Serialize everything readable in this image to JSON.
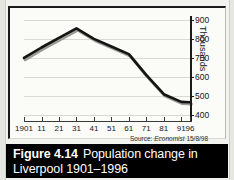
{
  "figure": {
    "caption_number": "Figure 4.14",
    "caption_text": "Population change in",
    "caption_text_line2": "Liverpool 1901–1996",
    "source_prefix": "Source:",
    "source_publication": "Economist",
    "source_date": "15/8/98"
  },
  "chart_data": {
    "type": "line",
    "title": "Population change in Liverpool 1901–1996",
    "xlabel": "",
    "ylabel": "Thousands",
    "categories": [
      "1901",
      "11",
      "21",
      "31",
      "41",
      "51",
      "61",
      "71",
      "81",
      "91",
      "96"
    ],
    "x": [
      1901,
      1911,
      1921,
      1931,
      1941,
      1951,
      1961,
      1971,
      1981,
      1991,
      1996
    ],
    "values": [
      700,
      755,
      805,
      855,
      800,
      760,
      720,
      610,
      510,
      470,
      468
    ],
    "ylim": [
      375,
      920
    ],
    "yticks": [
      400,
      500,
      600,
      700,
      800,
      900
    ],
    "ytick_labels": [
      "400",
      "500",
      "600",
      "700",
      "800",
      "900"
    ],
    "axis_position": "right",
    "grid": true,
    "legend": "none",
    "series_color": "#141414",
    "gridline_color": "#d9d9d4",
    "units": "thousands of people"
  }
}
